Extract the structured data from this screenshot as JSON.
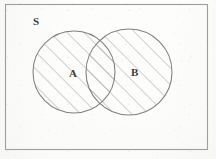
{
  "figure": {
    "kind": "venn-diagram",
    "labels": {
      "universe": "S",
      "set_a": "A",
      "set_b": "B"
    },
    "colors": {
      "page_background": "#fdfdfc",
      "ink": "#7a7a7a",
      "label_ink": "#3a3a3a",
      "hatch": "#8d8d8d"
    },
    "geometry": {
      "canvas": {
        "width": 216,
        "height": 159
      },
      "rectangle": {
        "x": 5,
        "y": 4,
        "width": 203,
        "height": 146
      },
      "circle_a": {
        "cx": 74,
        "cy": 72,
        "r": 41
      },
      "circle_b": {
        "cx": 129,
        "cy": 72,
        "r": 43
      },
      "hatch": {
        "angle_deg": 45,
        "spacing_px": 12,
        "stroke_width": 0.8
      }
    }
  }
}
